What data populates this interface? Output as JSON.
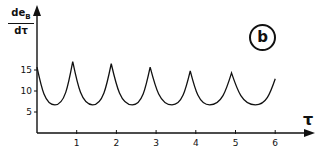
{
  "chart_data": {
    "type": "line",
    "title": "",
    "panel_label": "b",
    "ylabel": {
      "numerator": "de",
      "subscript": "B",
      "denominator": "dτ"
    },
    "xlabel": "τ",
    "x_ticks": [
      1,
      2,
      3,
      4,
      5,
      6
    ],
    "y_ticks": [
      5,
      10,
      15
    ],
    "xlim": [
      0,
      6.9
    ],
    "ylim": [
      0,
      30
    ],
    "grid": false,
    "legend": null,
    "series": [
      {
        "name": "deB/dτ",
        "x": [
          0.0,
          0.45,
          0.9,
          1.4,
          1.87,
          2.4,
          2.85,
          3.4,
          3.86,
          4.35,
          4.9,
          5.5,
          6.0
        ],
        "values": [
          15.7,
          6.7,
          17.0,
          6.7,
          16.5,
          6.7,
          15.7,
          6.7,
          14.8,
          6.7,
          14.3,
          6.7,
          12.9
        ]
      }
    ]
  },
  "ylabel_text": {
    "num": "de",
    "sub": "B",
    "den": "dτ"
  },
  "panel": "b",
  "x_axis_name": "τ",
  "x_tick_labels": [
    "1",
    "2",
    "3",
    "4",
    "5",
    "6"
  ],
  "y_tick_labels": [
    "5",
    "10",
    "15"
  ]
}
